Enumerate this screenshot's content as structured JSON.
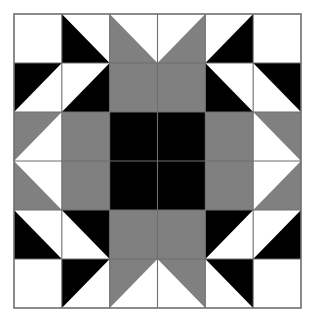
{
  "figure": {
    "type": "quilt-block-diagram",
    "width": 315,
    "height": 325
  },
  "colors": {
    "background": "#ffffff",
    "fabric_dark": "#000000",
    "fabric_medium": "#808080",
    "fabric_light": "#ffffff",
    "grid_line": "#6e6e6e",
    "outer_border": "#6e6e6e"
  },
  "geometry": {
    "origin_x": 14,
    "origin_y": 14,
    "block_width": 287,
    "block_height": 294,
    "grid_rows": 6,
    "grid_cols": 6,
    "cell_width": 47.833,
    "cell_height": 49.0,
    "grid_stroke_width": 1.1,
    "border_stroke_width": 1.6
  },
  "legend": {
    "dark_label": "Dark",
    "medium_label": "Medium",
    "light_label": "Light"
  },
  "chart_data": {
    "type": "heatmap",
    "rows": 6,
    "cols": 6,
    "palette": {
      "D": "#000000",
      "M": "#808080",
      "L": "#ffffff"
    },
    "shape_codes": {
      "full": "solid square",
      "tl": "triangle occupying top-left half (hypotenuse top-right to bottom-left)",
      "tr": "triangle occupying top-right half (hypotenuse top-left to bottom-right)",
      "bl": "triangle occupying bottom-left half (hypotenuse top-left to bottom-right)",
      "br": "triangle occupying bottom-right half (hypotenuse top-right to bottom-left)"
    },
    "cells": [
      [
        {
          "r": 0,
          "c": 0,
          "shape": "full",
          "fill": "L"
        },
        {
          "r": 0,
          "c": 1,
          "shape": "bl",
          "fill": "D",
          "bg": "L"
        },
        {
          "r": 0,
          "c": 2,
          "shape": "bl",
          "fill": "M",
          "bg": "L"
        },
        {
          "r": 0,
          "c": 3,
          "shape": "br",
          "fill": "M",
          "bg": "L"
        },
        {
          "r": 0,
          "c": 4,
          "shape": "br",
          "fill": "D",
          "bg": "L"
        },
        {
          "r": 0,
          "c": 5,
          "shape": "full",
          "fill": "L"
        }
      ],
      [
        {
          "r": 1,
          "c": 0,
          "shape": "tl",
          "fill": "D",
          "bg": "L"
        },
        {
          "r": 1,
          "c": 1,
          "shape": "br",
          "fill": "D",
          "bg": "L"
        },
        {
          "r": 1,
          "c": 2,
          "shape": "full",
          "fill": "M"
        },
        {
          "r": 1,
          "c": 3,
          "shape": "full",
          "fill": "M"
        },
        {
          "r": 1,
          "c": 4,
          "shape": "bl",
          "fill": "D",
          "bg": "L"
        },
        {
          "r": 1,
          "c": 5,
          "shape": "tr",
          "fill": "D",
          "bg": "L"
        }
      ],
      [
        {
          "r": 2,
          "c": 0,
          "shape": "tl",
          "fill": "M",
          "bg": "L"
        },
        {
          "r": 2,
          "c": 1,
          "shape": "full",
          "fill": "M"
        },
        {
          "r": 2,
          "c": 2,
          "shape": "full",
          "fill": "D"
        },
        {
          "r": 2,
          "c": 3,
          "shape": "full",
          "fill": "D"
        },
        {
          "r": 2,
          "c": 4,
          "shape": "full",
          "fill": "M"
        },
        {
          "r": 2,
          "c": 5,
          "shape": "tr",
          "fill": "M",
          "bg": "L"
        }
      ],
      [
        {
          "r": 3,
          "c": 0,
          "shape": "bl",
          "fill": "M",
          "bg": "L"
        },
        {
          "r": 3,
          "c": 1,
          "shape": "full",
          "fill": "M"
        },
        {
          "r": 3,
          "c": 2,
          "shape": "full",
          "fill": "D"
        },
        {
          "r": 3,
          "c": 3,
          "shape": "full",
          "fill": "D"
        },
        {
          "r": 3,
          "c": 4,
          "shape": "full",
          "fill": "M"
        },
        {
          "r": 3,
          "c": 5,
          "shape": "br",
          "fill": "M",
          "bg": "L"
        }
      ],
      [
        {
          "r": 4,
          "c": 0,
          "shape": "bl",
          "fill": "D",
          "bg": "L"
        },
        {
          "r": 4,
          "c": 1,
          "shape": "tr",
          "fill": "D",
          "bg": "L"
        },
        {
          "r": 4,
          "c": 2,
          "shape": "full",
          "fill": "M"
        },
        {
          "r": 4,
          "c": 3,
          "shape": "full",
          "fill": "M"
        },
        {
          "r": 4,
          "c": 4,
          "shape": "tl",
          "fill": "D",
          "bg": "L"
        },
        {
          "r": 4,
          "c": 5,
          "shape": "br",
          "fill": "D",
          "bg": "L"
        }
      ],
      [
        {
          "r": 5,
          "c": 0,
          "shape": "full",
          "fill": "L"
        },
        {
          "r": 5,
          "c": 1,
          "shape": "tl",
          "fill": "D",
          "bg": "L"
        },
        {
          "r": 5,
          "c": 2,
          "shape": "tl",
          "fill": "M",
          "bg": "L"
        },
        {
          "r": 5,
          "c": 3,
          "shape": "tr",
          "fill": "M",
          "bg": "L"
        },
        {
          "r": 5,
          "c": 4,
          "shape": "tr",
          "fill": "D",
          "bg": "L"
        },
        {
          "r": 5,
          "c": 5,
          "shape": "full",
          "fill": "L"
        }
      ]
    ]
  }
}
